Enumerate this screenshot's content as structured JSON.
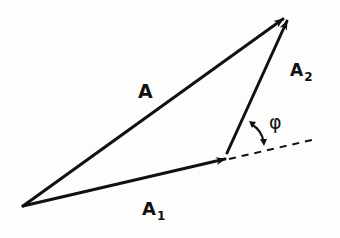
{
  "diagram": {
    "type": "phasor-addition",
    "stroke_color": "#111111",
    "background": "#fdfdfc",
    "vectors": [
      {
        "name": "A",
        "label": "A",
        "subscript": "",
        "from": [
          23,
          206
        ],
        "to": [
          284,
          18
        ]
      },
      {
        "name": "A1",
        "label": "A",
        "subscript": "1",
        "from": [
          23,
          206
        ],
        "to": [
          226,
          159
        ]
      },
      {
        "name": "A2",
        "label": "A",
        "subscript": "2",
        "from": [
          227,
          153
        ],
        "to": [
          288,
          20
        ]
      }
    ],
    "reference_line": {
      "style": "dashed",
      "from": [
        228,
        159
      ],
      "to": [
        316,
        139
      ]
    },
    "angle": {
      "label": "φ",
      "between": [
        "A2",
        "reference_line"
      ]
    }
  }
}
